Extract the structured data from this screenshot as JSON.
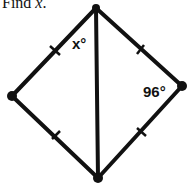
{
  "problem": {
    "prompt_prefix": "Find ",
    "prompt_var": "x",
    "prompt_suffix": "."
  },
  "figure": {
    "shape": "kite/rhombus with diagonal",
    "angle_labels": {
      "top": "x°",
      "right": "96°"
    },
    "vertices": {
      "top": [
        96,
        8
      ],
      "left": [
        12,
        96
      ],
      "right": [
        182,
        86
      ],
      "bottom": [
        98,
        178
      ]
    },
    "tick_marks": 4
  }
}
